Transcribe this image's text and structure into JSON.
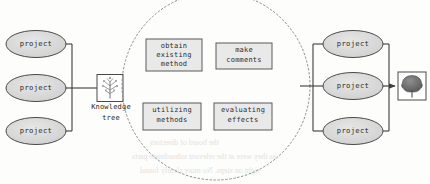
{
  "diagram": {
    "background_color": "#fdfdfc",
    "stroke_color": "#4a4a4a",
    "ellipse_fill": "#d9d9d9",
    "box_fill": "#e8e8e8",
    "circle_stroke": "#8a8a8a",
    "left_group": {
      "name": "input-projects",
      "nodes": [
        {
          "id": "left-project-1",
          "label": "project",
          "shape": "ellipse"
        },
        {
          "id": "left-project-2",
          "label": "project",
          "shape": "ellipse"
        },
        {
          "id": "left-project-3",
          "label": "project",
          "shape": "ellipse"
        }
      ]
    },
    "knowledge_tree": {
      "name": "knowledge-tree-node",
      "icon": "sapling-tree-icon",
      "caption_line1": "Knowledge",
      "caption_line2": "tree"
    },
    "process_circle": {
      "name": "process-circle",
      "style": "dotted",
      "boxes": [
        {
          "id": "obtain-existing-method",
          "lines": [
            "obtain",
            "existing",
            "method"
          ],
          "position": "top-left"
        },
        {
          "id": "make-comments",
          "lines": [
            "make",
            "comments"
          ],
          "position": "top-right"
        },
        {
          "id": "utilizing-methods",
          "lines": [
            "utilizing",
            "methods"
          ],
          "position": "bottom-left"
        },
        {
          "id": "evaluating-effects",
          "lines": [
            "evaluating",
            "effects"
          ],
          "position": "bottom-right"
        }
      ]
    },
    "right_group": {
      "name": "output-projects",
      "nodes": [
        {
          "id": "right-project-1",
          "label": "project",
          "shape": "ellipse"
        },
        {
          "id": "right-project-2",
          "label": "project",
          "shape": "ellipse"
        },
        {
          "id": "right-project-3",
          "label": "project",
          "shape": "ellipse"
        }
      ]
    },
    "grown_tree": {
      "name": "grown-tree-node",
      "icon": "mature-tree-icon"
    },
    "bleed_through": {
      "line1": "the board of directors",
      "line2": "as they were at the relevant subordinate parts",
      "line3": "right on steps. No more clearly found"
    }
  }
}
